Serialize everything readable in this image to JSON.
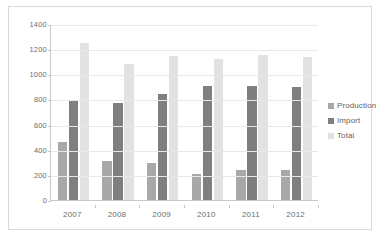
{
  "chart_data": {
    "type": "bar",
    "title": "",
    "xlabel": "",
    "ylabel": "",
    "categories": [
      "2007",
      "2008",
      "2009",
      "2010",
      "2011",
      "2012"
    ],
    "series": [
      {
        "name": "Production",
        "color": "#a8a8a8",
        "values": [
          465,
          310,
          295,
          210,
          235,
          240
        ]
      },
      {
        "name": "Import",
        "color": "#7f7f7f",
        "values": [
          785,
          775,
          845,
          905,
          910,
          900
        ]
      },
      {
        "name": "Total",
        "color": "#e2e2e2",
        "values": [
          1250,
          1085,
          1145,
          1125,
          1150,
          1140
        ]
      }
    ],
    "ylim": [
      0,
      1400
    ],
    "ytick_values": [
      0,
      200,
      400,
      600,
      800,
      1000,
      1200,
      1400
    ],
    "ytick_labels": [
      "0",
      "200",
      "400",
      "600",
      "800",
      "1000",
      "1200",
      "1400"
    ],
    "grid": true,
    "legend_position": "right",
    "legend_entries": [
      "Production",
      "Import",
      "Total"
    ]
  },
  "colors": {
    "plot_background": "#ffffff",
    "frame_border": "#d9d9d9",
    "axis_line": "#c8c8c8",
    "gridline": "#e8e8e8",
    "tick_text": "#6d6d6d",
    "legend_text": "#5f5f5f"
  }
}
